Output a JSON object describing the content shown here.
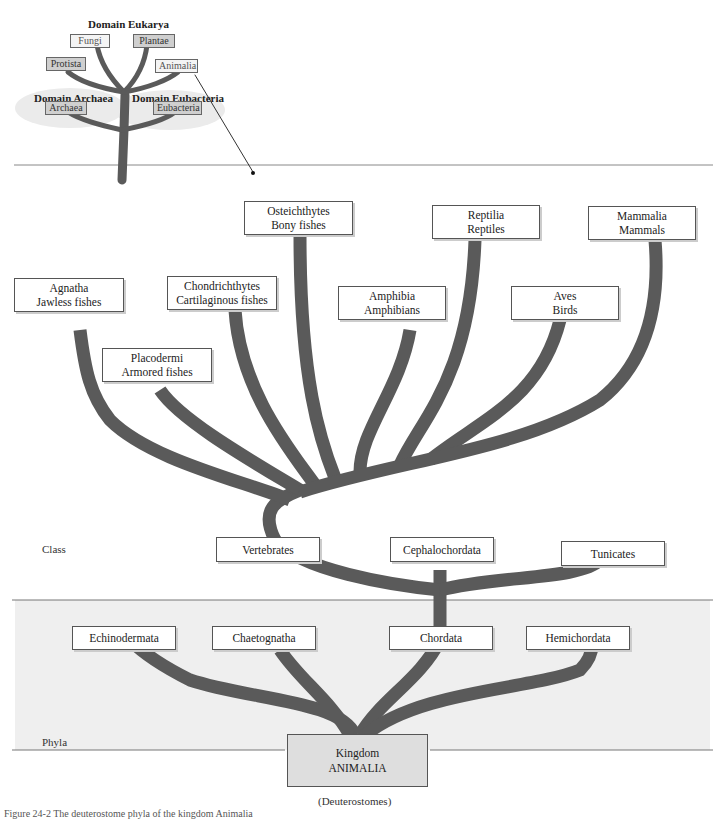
{
  "inset": {
    "domains": {
      "eukarya": "Domain Eukarya",
      "archaea": "Domain Archaea",
      "eubacteria": "Domain Eubacteria"
    },
    "kingdoms": {
      "fungi": "Fungi",
      "plantae": "Plantae",
      "protista": "Protista",
      "animalia": "Animalia",
      "archaea": "Archaea",
      "eubacteria": "Eubacteria"
    }
  },
  "classes": {
    "agnatha": {
      "name": "Agnatha",
      "common": "Jawless fishes"
    },
    "placodermi": {
      "name": "Placodermi",
      "common": "Armored fishes"
    },
    "chondrichthytes": {
      "name": "Chondrichthytes",
      "common": "Cartilaginous fishes"
    },
    "osteichthytes": {
      "name": "Osteichthytes",
      "common": "Bony fishes"
    },
    "amphibia": {
      "name": "Amphibia",
      "common": "Amphibians"
    },
    "reptilia": {
      "name": "Reptilia",
      "common": "Reptiles"
    },
    "aves": {
      "name": "Aves",
      "common": "Birds"
    },
    "mammalia": {
      "name": "Mammalia",
      "common": "Mammals"
    }
  },
  "subphyla": {
    "vertebrates": "Vertebrates",
    "cephalochordata": "Cephalochordata",
    "tunicates": "Tunicates"
  },
  "phyla": {
    "echinodermata": "Echinodermata",
    "chaetognatha": "Chaetognatha",
    "chordata": "Chordata",
    "hemichordata": "Hemichordata"
  },
  "rank_labels": {
    "class": "Class",
    "phyla": "Phyla"
  },
  "root": {
    "line1": "Kingdom",
    "line2": "ANIMALIA",
    "group": "(Deuterostomes)"
  },
  "caption": "Figure 24-2  The deuterostome phyla of the kingdom Animalia",
  "colors": {
    "branch": "#5a5a5a",
    "phyla_band": "#eeeeee",
    "kingdom_box": "#dedede"
  }
}
